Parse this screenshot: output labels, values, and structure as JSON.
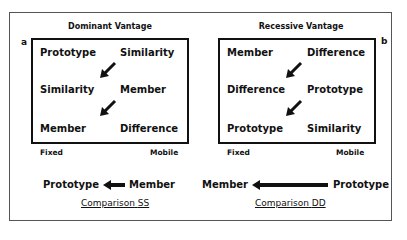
{
  "panels": [
    {
      "letter": "a",
      "title": "Dominant Vantage",
      "rows": [
        {
          "left": "Prototype",
          "right": "Similarity"
        },
        {
          "left": "Similarity",
          "right": "Member"
        },
        {
          "left": "Member",
          "right": "Difference"
        }
      ],
      "axis_left": "Fixed",
      "axis_right": "Mobile",
      "comparison": {
        "left_term": "Prototype",
        "right_term": "Member",
        "arrow_direction": "left",
        "label": "Comparison",
        "code": "SS"
      }
    },
    {
      "letter": "b",
      "title": "Recessive Vantage",
      "rows": [
        {
          "left": "Member",
          "right": "Difference"
        },
        {
          "left": "Difference",
          "right": "Prototype"
        },
        {
          "left": "Prototype",
          "right": "Similarity"
        }
      ],
      "axis_left": "Fixed",
      "axis_right": "Mobile",
      "comparison": {
        "left_term": "Member",
        "right_term": "Prototype",
        "arrow_direction": "left",
        "label": "Comparison",
        "code": "DD"
      }
    }
  ]
}
